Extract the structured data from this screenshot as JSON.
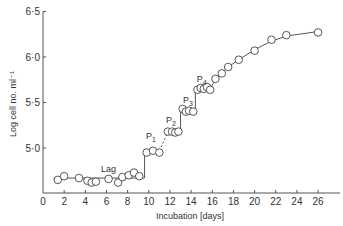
{
  "chart_data": {
    "type": "scatter",
    "title": "",
    "xlabel": "Incubation [days]",
    "ylabel": "Log cell no. ml⁻¹",
    "xlim": [
      0,
      28
    ],
    "ylim": [
      4.5,
      6.5
    ],
    "xticks": [
      0,
      2,
      4,
      6,
      8,
      10,
      12,
      14,
      16,
      18,
      20,
      22,
      24,
      26
    ],
    "xtick_labels": [
      "0",
      "2",
      "4",
      "6",
      "8",
      "10",
      "12",
      "14",
      "16",
      "18",
      "20",
      "22",
      "24",
      "26"
    ],
    "yticks": [
      5.0,
      5.5,
      6.0,
      6.5
    ],
    "ytick_labels": [
      "5·0",
      "5·5",
      "6·0",
      "6·5"
    ],
    "grid": false,
    "legend": null,
    "annotations": [
      {
        "text": "Lag",
        "x": 6.2,
        "y": 4.74
      },
      {
        "text": "P1",
        "x": 10.2,
        "y": 5.1
      },
      {
        "text": "P2",
        "x": 12.1,
        "y": 5.27
      },
      {
        "text": "P3",
        "x": 13.7,
        "y": 5.49
      },
      {
        "text": "P4",
        "x": 15.0,
        "y": 5.73
      }
    ],
    "series": [
      {
        "name": "Observed",
        "marker": "open-circle",
        "x": [
          1.4,
          2.0,
          3.4,
          4.2,
          4.6,
          5.0,
          6.2,
          7.1,
          7.5,
          8.1,
          8.6,
          9.1,
          9.8,
          10.4,
          11.0,
          11.8,
          12.2,
          12.5,
          12.8,
          13.2,
          13.5,
          13.8,
          14.2,
          14.6,
          14.9,
          15.2,
          15.5,
          15.8,
          16.3,
          16.9,
          17.5,
          18.5,
          20.0,
          21.6,
          23.0,
          26.0
        ],
        "y": [
          4.65,
          4.69,
          4.67,
          4.64,
          4.62,
          4.63,
          4.66,
          4.62,
          4.68,
          4.7,
          4.73,
          4.69,
          4.95,
          4.97,
          4.95,
          5.18,
          5.18,
          5.17,
          5.18,
          5.43,
          5.4,
          5.41,
          5.4,
          5.64,
          5.66,
          5.65,
          5.67,
          5.64,
          5.76,
          5.82,
          5.89,
          5.97,
          6.07,
          6.19,
          6.24,
          6.27
        ]
      }
    ],
    "fit_lines": {
      "lag": {
        "x": [
          1,
          9.6
        ],
        "y": [
          4.67,
          4.67
        ]
      },
      "step_p1": {
        "x": [
          9.6,
          9.6
        ],
        "y": [
          4.67,
          4.97
        ]
      },
      "dashed_p1_p2": {
        "x": [
          11.0,
          11.8
        ],
        "y": [
          4.97,
          5.17
        ]
      },
      "step_p2_p3": {
        "x": [
          13.0,
          13.0
        ],
        "y": [
          5.17,
          5.42
        ]
      },
      "step_p3_p4": {
        "x": [
          14.4,
          14.4
        ],
        "y": [
          5.42,
          5.65
        ]
      },
      "growth_curve": {
        "x": [
          15.8,
          16.5,
          17.5,
          18.5,
          20,
          21.5,
          23,
          26
        ],
        "y": [
          5.66,
          5.78,
          5.89,
          5.97,
          6.08,
          6.17,
          6.23,
          6.28
        ]
      }
    }
  }
}
